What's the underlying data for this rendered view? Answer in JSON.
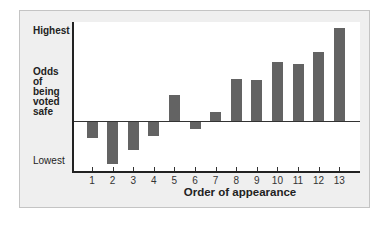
{
  "chart_data": {
    "type": "bar",
    "title": "",
    "xlabel": "Order of appearance",
    "ylabel": "Odds of being voted safe",
    "y_tick_labels": {
      "top": "Highest",
      "bottom": "Lowest"
    },
    "categories": [
      "1",
      "2",
      "3",
      "4",
      "5",
      "6",
      "7",
      "8",
      "9",
      "10",
      "11",
      "12",
      "13"
    ],
    "values": [
      -17,
      -43,
      -29,
      -15,
      26,
      -8,
      9,
      42,
      41,
      59,
      57,
      69,
      93
    ],
    "ylim": [
      -50,
      100
    ],
    "grid": false,
    "bar_color": "#636363",
    "panel_color": "#efefef"
  },
  "labels": {
    "highest": "Highest",
    "lowest": "Lowest",
    "ylabel_lines": [
      "Odds",
      "of",
      "being",
      "voted",
      "safe"
    ],
    "xlabel": "Order of appearance"
  }
}
